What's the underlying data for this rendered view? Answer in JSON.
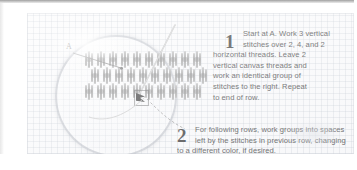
{
  "diagram": {
    "point_label": "A",
    "magnifier_name": "magnified-stitch-detail",
    "stitch_color": "#9a9a9a",
    "grid_color": "#b0b8c4",
    "rows": 3,
    "groups_per_row": 10,
    "stitches_per_group": 3
  },
  "steps": [
    {
      "number": "1",
      "lines": [
        "Start at A. Work 3 vertical",
        "stitches over 2, 4, and 2",
        "horizontal threads. Leave 2",
        "vertical canvas threads and",
        "work an identical group of",
        "stitches to the right. Repeat",
        "to end of row."
      ]
    },
    {
      "number": "2",
      "lines": [
        "For following rows, work groups into spaces",
        "left by the stitches in previous row, changing",
        "to a different color, if desired."
      ]
    }
  ]
}
